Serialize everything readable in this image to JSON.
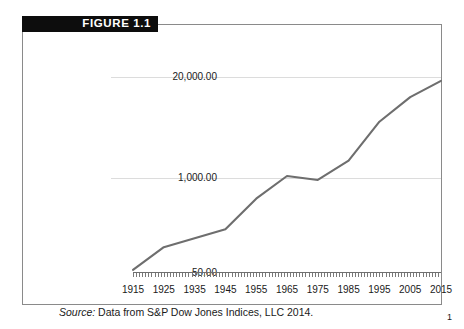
{
  "figure": {
    "banner_label": "FIGURE 1.1"
  },
  "source": {
    "label": "Source:",
    "text": " Data from S&P Dow Jones Indices, LLC 2014."
  },
  "page": {
    "number": "1"
  },
  "chart_data": {
    "type": "line",
    "title": "",
    "xlabel": "",
    "ylabel": "",
    "yscale": "log",
    "grid": true,
    "legend": "none",
    "line_color": "#6e6e6e",
    "grid_color": "#dcdcdc",
    "axis_color": "#6f6f6f",
    "xlim": [
      1915,
      2015
    ],
    "ylim": [
      50.0,
      20000.0
    ],
    "ytick_labels": [
      "20,000.00",
      "1,000.00",
      "50.00"
    ],
    "ytick_values": [
      20000.0,
      1000.0,
      50.0
    ],
    "xtick_labels": [
      "1915",
      "1925",
      "1935",
      "1945",
      "1955",
      "1965",
      "1975",
      "1985",
      "1995",
      "2005",
      "2015"
    ],
    "xtick_values": [
      1915,
      1925,
      1935,
      1945,
      1955,
      1965,
      1975,
      1985,
      1995,
      2005,
      2015
    ],
    "series": [
      {
        "name": "Dow Jones Industrial Average",
        "x": [
          1915,
          1925,
          1935,
          1945,
          1955,
          1965,
          1975,
          1985,
          1995,
          2005,
          2015
        ],
        "values": [
          55,
          110,
          145,
          190,
          485,
          970,
          860,
          1550,
          5100,
          10800,
          17800
        ]
      }
    ]
  }
}
